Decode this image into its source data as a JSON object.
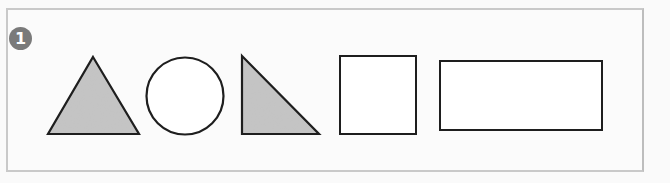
{
  "badge": {
    "number": "1"
  },
  "shapes": [
    {
      "name": "triangle",
      "fill": "shaded"
    },
    {
      "name": "circle",
      "fill": "none"
    },
    {
      "name": "right-triangle",
      "fill": "shaded"
    },
    {
      "name": "square",
      "fill": "none"
    },
    {
      "name": "rectangle",
      "fill": "none"
    }
  ],
  "colors": {
    "stroke": "#1e1e1e",
    "shade": "#b8b8b8",
    "frame": "#c9c9c9",
    "badge": "#7a7a7a"
  }
}
